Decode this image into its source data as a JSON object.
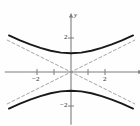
{
  "figure": {
    "kind": "coordinate-plane-graph",
    "background_color": "#fefefe",
    "curve_color": "#1a1a1a",
    "asymptote_color": "#8c8c8c",
    "axis_color": "#7d7d7d",
    "text_color": "#2b2b2b"
  },
  "axes": {
    "x_label": "x",
    "y_label": "y",
    "x_range": [
      -3.9,
      3.9
    ],
    "y_range": [
      -3.1,
      3.2
    ],
    "x_ticks": [
      -2,
      -1,
      1,
      2
    ],
    "y_ticks": [
      2,
      -2
    ],
    "x_tick_labels": [
      {
        "value": -2,
        "text": "−2"
      },
      {
        "value": 2,
        "text": "2"
      }
    ],
    "y_tick_labels": [
      {
        "value": 2,
        "text": "2"
      },
      {
        "value": -2,
        "text": "−2"
      }
    ],
    "grid": false,
    "arrows": [
      "x-positive",
      "y-positive"
    ]
  },
  "chart_data": {
    "type": "line",
    "title": "",
    "xlabel": "x",
    "ylabel": "y",
    "xlim": [
      -3.9,
      3.9
    ],
    "ylim": [
      -3.1,
      3.2
    ],
    "grid": false,
    "legend": "none",
    "equation": "y²/1.1² − x²/2.2² = 1",
    "conic": "hyperbola",
    "transverse_axis": "vertical",
    "center": [
      0,
      0
    ],
    "a": 1.1,
    "b": 2.2,
    "vertices": [
      [
        0,
        1.1
      ],
      [
        0,
        -1.1
      ]
    ],
    "series": [
      {
        "name": "upper branch",
        "style": "solid",
        "x": [
          -3.65,
          -3.0,
          -2.4,
          -1.8,
          -1.2,
          -0.6,
          0,
          0.6,
          1.2,
          1.8,
          2.4,
          3.0,
          3.65
        ],
        "y": [
          2.15,
          1.86,
          1.63,
          1.42,
          1.25,
          1.14,
          1.1,
          1.14,
          1.25,
          1.42,
          1.63,
          1.86,
          2.15
        ]
      },
      {
        "name": "lower branch",
        "style": "solid",
        "x": [
          -3.65,
          -3.0,
          -2.4,
          -1.8,
          -1.2,
          -0.6,
          0,
          0.6,
          1.2,
          1.8,
          2.4,
          3.0,
          3.65
        ],
        "y": [
          -2.15,
          -1.86,
          -1.63,
          -1.42,
          -1.25,
          -1.14,
          -1.1,
          -1.14,
          -1.25,
          -1.42,
          -1.63,
          -1.86,
          -2.15
        ]
      },
      {
        "name": "asymptote positive slope",
        "style": "dashed",
        "slope": 0.5,
        "x": [
          -3.75,
          3.75
        ],
        "y": [
          -1.875,
          1.875
        ]
      },
      {
        "name": "asymptote negative slope",
        "style": "dashed",
        "slope": -0.5,
        "x": [
          -3.75,
          3.75
        ],
        "y": [
          1.875,
          -1.875
        ]
      }
    ]
  }
}
